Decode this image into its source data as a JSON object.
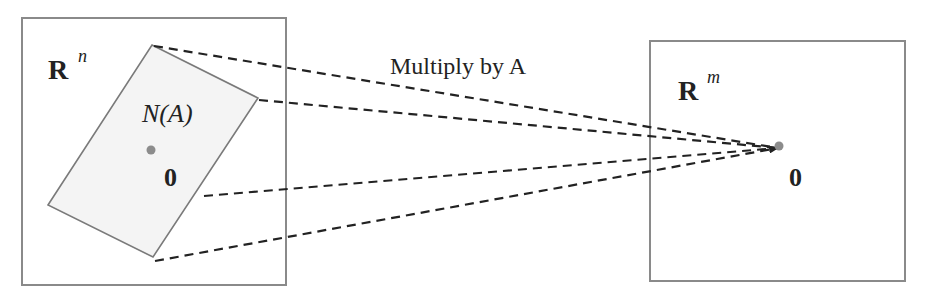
{
  "diagram": {
    "domain_space": {
      "label": "R",
      "superscript": "n",
      "subspace_label": "N(A)",
      "zero_label": "0"
    },
    "codomain_space": {
      "label": "R",
      "superscript": "m",
      "zero_label": "0"
    },
    "mapping_label": "Multiply by A",
    "colors": {
      "box_stroke": "#8a8a8a",
      "subspace_fill": "#f4f4f4",
      "subspace_stroke": "#7a7a7a",
      "dot": "#8c8c8c",
      "dashed_lines": "#222222"
    }
  }
}
